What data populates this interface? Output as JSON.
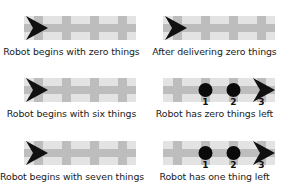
{
  "figure": {
    "panels": [
      {
        "caption": "Robot begins with zero things",
        "robot": "start",
        "things": []
      },
      {
        "caption": "After delivering zero things",
        "robot": "start",
        "things": []
      },
      {
        "caption": "Robot begins with six things",
        "robot": "start",
        "things": []
      },
      {
        "caption": "Robot has zero things left",
        "robot": "end",
        "things": [
          {
            "label": "1"
          },
          {
            "label": "2"
          },
          {
            "label": "3"
          }
        ]
      },
      {
        "caption": "Robot begins with seven things",
        "robot": "start",
        "things": []
      },
      {
        "caption": "Robot has one thing left",
        "robot": "end",
        "things": [
          {
            "label": "1"
          },
          {
            "label": "2"
          },
          {
            "label": "3"
          }
        ]
      }
    ],
    "colors": {
      "track_light": "#e3e3e3",
      "track_dark": "#bdbdbd",
      "robot": "#111111",
      "thing": "#0a0a0a"
    }
  }
}
